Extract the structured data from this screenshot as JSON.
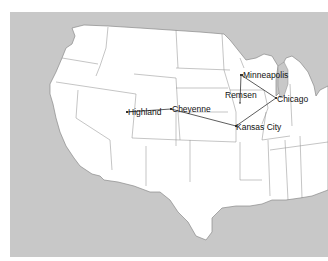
{
  "map": {
    "type": "route-map",
    "region": "Continental United States",
    "colors": {
      "water": "#c8c8c8",
      "land": "#ffffff",
      "borders": "#8a8a8a",
      "route": "#333333",
      "text": "#111111"
    },
    "cities": [
      {
        "name": "Minneapolis",
        "x": 241,
        "y": 75
      },
      {
        "name": "Remsen",
        "x": 240,
        "y": 103
      },
      {
        "name": "Chicago",
        "x": 276,
        "y": 98
      },
      {
        "name": "Highland",
        "x": 127,
        "y": 112
      },
      {
        "name": "Cheyenne",
        "x": 171,
        "y": 109
      },
      {
        "name": "Kansas City",
        "x": 236,
        "y": 126
      }
    ],
    "routes": [
      [
        "Highland",
        "Cheyenne"
      ],
      [
        "Cheyenne",
        "Kansas City"
      ],
      [
        "Kansas City",
        "Chicago"
      ],
      [
        "Chicago",
        "Minneapolis"
      ],
      [
        "Minneapolis",
        "Remsen"
      ]
    ]
  }
}
